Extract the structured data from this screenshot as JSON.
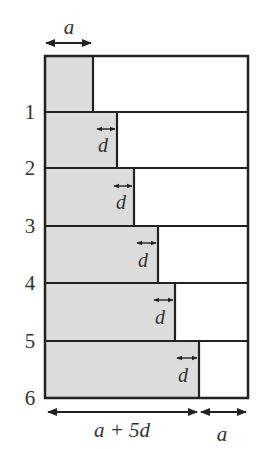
{
  "diagram": {
    "top_label": "a",
    "row_labels": [
      "1",
      "2",
      "3",
      "4",
      "5",
      "6"
    ],
    "increment_label": "d",
    "bottom_left_label": "a + 5d",
    "bottom_right_label": "a",
    "colors": {
      "fill": "#dcdcdc",
      "stroke": "#222222",
      "text": "#333333"
    },
    "rows": [
      {
        "index": 0,
        "gray_width_label": "a",
        "shows_d": false
      },
      {
        "index": 1,
        "gray_width_label": "a + d",
        "shows_d": true
      },
      {
        "index": 2,
        "gray_width_label": "a + 2d",
        "shows_d": true
      },
      {
        "index": 3,
        "gray_width_label": "a + 3d",
        "shows_d": true
      },
      {
        "index": 4,
        "gray_width_label": "a + 4d",
        "shows_d": true
      },
      {
        "index": 5,
        "gray_width_label": "a + 5d",
        "shows_d": true
      }
    ]
  }
}
